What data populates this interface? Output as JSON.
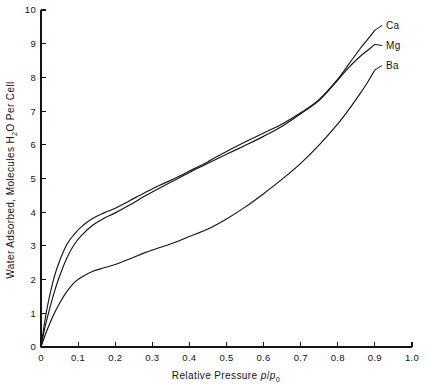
{
  "chart_data": {
    "type": "line",
    "title": "",
    "xlabel": "Relative Pressure p/p₀",
    "xlabel_parts": {
      "text": "Relative Pressure ",
      "italic_a": "p",
      "slash": "/",
      "italic_b": "p",
      "subscript": "0"
    },
    "ylabel": "Water Adsorbed, Molecules H₂O Per Cell",
    "ylabel_parts": {
      "pre": "Water Adsorbed, Molecules H",
      "subscript": "2",
      "post": "O Per Cell"
    },
    "xlim": [
      0,
      1.0
    ],
    "ylim": [
      0,
      10
    ],
    "xticks": [
      0,
      0.1,
      0.2,
      0.3,
      0.4,
      0.5,
      0.6,
      0.7,
      0.8,
      0.9,
      1.0
    ],
    "xticklabels": [
      "0",
      "0.1",
      "0.2",
      "0.3",
      "0.4",
      "0.5",
      "0.6",
      "0.7",
      "0.8",
      "0.9",
      "1.0"
    ],
    "yticks": [
      0,
      1,
      2,
      3,
      4,
      5,
      6,
      7,
      8,
      9,
      10
    ],
    "yticklabels": [
      "0",
      "1",
      "2",
      "3",
      "4",
      "5",
      "6",
      "7",
      "8",
      "9",
      "10"
    ],
    "grid": false,
    "legend_position": "right-inline-end-of-curve",
    "series": [
      {
        "name": "Ca",
        "label": "Ca",
        "color": "#141414",
        "x": [
          0.0,
          0.01,
          0.02,
          0.035,
          0.05,
          0.07,
          0.09,
          0.11,
          0.14,
          0.17,
          0.2,
          0.24,
          0.28,
          0.32,
          0.36,
          0.4,
          0.45,
          0.5,
          0.55,
          0.6,
          0.65,
          0.7,
          0.75,
          0.8,
          0.83,
          0.86,
          0.88,
          0.9
        ],
        "y": [
          0.0,
          0.75,
          1.35,
          2.05,
          2.55,
          3.05,
          3.35,
          3.58,
          3.82,
          3.98,
          4.12,
          4.35,
          4.58,
          4.8,
          5.0,
          5.22,
          5.5,
          5.8,
          6.08,
          6.35,
          6.62,
          6.95,
          7.35,
          7.95,
          8.4,
          8.85,
          9.12,
          9.4
        ]
      },
      {
        "name": "Mg",
        "label": "Mg",
        "color": "#141414",
        "x": [
          0.0,
          0.01,
          0.02,
          0.035,
          0.05,
          0.07,
          0.09,
          0.11,
          0.14,
          0.17,
          0.2,
          0.24,
          0.28,
          0.32,
          0.36,
          0.4,
          0.45,
          0.5,
          0.55,
          0.6,
          0.65,
          0.7,
          0.75,
          0.8,
          0.83,
          0.86,
          0.88,
          0.9
        ],
        "y": [
          0.0,
          0.55,
          1.0,
          1.6,
          2.1,
          2.65,
          3.05,
          3.32,
          3.62,
          3.82,
          3.98,
          4.22,
          4.48,
          4.72,
          4.95,
          5.18,
          5.45,
          5.72,
          5.98,
          6.25,
          6.55,
          6.92,
          7.32,
          7.92,
          8.3,
          8.62,
          8.8,
          8.98
        ]
      },
      {
        "name": "Ba",
        "label": "Ba",
        "color": "#141414",
        "x": [
          0.0,
          0.01,
          0.02,
          0.035,
          0.05,
          0.07,
          0.09,
          0.11,
          0.14,
          0.17,
          0.2,
          0.24,
          0.28,
          0.32,
          0.36,
          0.4,
          0.45,
          0.5,
          0.55,
          0.6,
          0.65,
          0.7,
          0.75,
          0.8,
          0.83,
          0.86,
          0.88,
          0.9
        ],
        "y": [
          0.0,
          0.32,
          0.6,
          0.98,
          1.3,
          1.65,
          1.92,
          2.08,
          2.25,
          2.35,
          2.45,
          2.62,
          2.8,
          2.95,
          3.1,
          3.28,
          3.5,
          3.8,
          4.15,
          4.55,
          4.98,
          5.45,
          6.0,
          6.62,
          7.05,
          7.52,
          7.85,
          8.22
        ]
      }
    ]
  },
  "figure": {
    "background_color": "#ffffff",
    "line_color": "#141414"
  }
}
